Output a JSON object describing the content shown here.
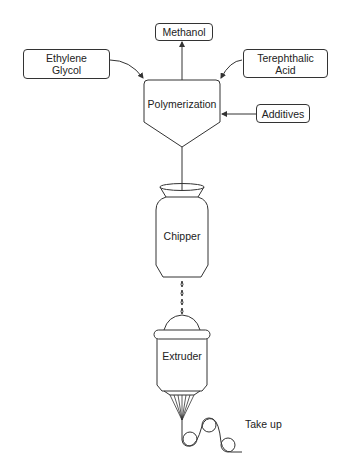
{
  "diagram": {
    "title": "",
    "inputs": {
      "ethylene_glycol": {
        "line1": "Ethylene",
        "line2": "Glycol"
      },
      "terephthalic_acid": {
        "line1": "Terephthalic",
        "line2": "Acid"
      },
      "additives": "Additives"
    },
    "outputs": {
      "methanol": "Methanol"
    },
    "units": {
      "polymerization": "Polymerization",
      "chipper": "Chipper",
      "extruder": "Extruder",
      "take_up": "Take up"
    },
    "flow": [
      {
        "from": "Ethylene Glycol",
        "to": "Polymerization"
      },
      {
        "from": "Terephthalic Acid",
        "to": "Polymerization"
      },
      {
        "from": "Additives",
        "to": "Polymerization"
      },
      {
        "from": "Polymerization",
        "to": "Methanol"
      },
      {
        "from": "Polymerization",
        "to": "Chipper"
      },
      {
        "from": "Chipper",
        "to": "Extruder"
      },
      {
        "from": "Extruder",
        "to": "Take up"
      }
    ],
    "colors": {
      "stroke": "#333333",
      "background": "#ffffff",
      "text": "#222222"
    }
  }
}
